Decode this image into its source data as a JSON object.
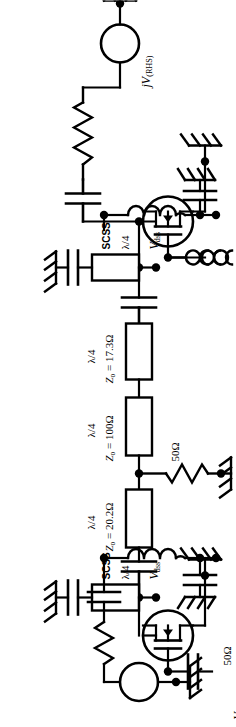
{
  "figure": {
    "type": "circuit-schematic",
    "orientation": "rotated-90-ccw",
    "width": 236,
    "height": 727,
    "line_color": "#000000",
    "background_color": "#ffffff"
  },
  "sources": {
    "right": {
      "label_prefix": "j",
      "label_main": "V",
      "label_sub": "(RHS)",
      "full": "jV(RHS)"
    },
    "left": {
      "label_prefix": "",
      "label_main": "V",
      "label_sub": "(LHS)",
      "full": "V(LHS)"
    }
  },
  "resistors": [
    {
      "name": "source-resistor-rhs",
      "value": ""
    },
    {
      "name": "shunt-resistor-center",
      "value": "50Ω"
    },
    {
      "name": "source-resistor-lhs",
      "value": "50Ω"
    }
  ],
  "transmission_lines": [
    {
      "name": "tline-drain-rhs",
      "length": "λ/4",
      "impedance": "",
      "stub_label": "SCSS"
    },
    {
      "name": "tline-17-3",
      "length": "λ/4",
      "impedance_symbol": "Z",
      "impedance_sub": "o",
      "impedance_value": "17.3Ω",
      "impedance": "Z₀ = 17.3Ω"
    },
    {
      "name": "tline-100",
      "length": "λ/4",
      "impedance_symbol": "Z",
      "impedance_sub": "o",
      "impedance_value": "100Ω",
      "impedance": "Z₀ = 100Ω"
    },
    {
      "name": "tline-20-2",
      "length": "λ/4",
      "impedance_symbol": "Z",
      "impedance_sub": "o",
      "impedance_value": "20.2Ω",
      "impedance": "Z₀ = 20.2Ω"
    },
    {
      "name": "tline-drain-lhs",
      "length": "λ/4",
      "impedance": "",
      "stub_label": "SCSS"
    }
  ],
  "bias": {
    "stub_label": "SCSS",
    "quarter_wave": "λ/4",
    "drain_supply_symbol": "V",
    "drain_supply_sub": "dss",
    "drain_supply": "Vdss",
    "gate_supply_symbol": "V",
    "gate_supply_sub": "gs",
    "gate_supply": "Vgs"
  },
  "nodes": {
    "drain_supply_rhs": "Vdss",
    "drain_supply_lhs": "Vdss",
    "gate_bias_rhs": "Vgs",
    "gate_bias_lhs": "Vgs"
  },
  "components": {
    "transistor_rhs": "mosfet-rhs",
    "transistor_lhs": "mosfet-lhs",
    "inductor_rhs": "gate-choke-rhs",
    "inductor_lhs": "gate-choke-lhs",
    "capacitors": [
      "dc-block-drain-rhs",
      "bypass-cap-rhs",
      "gate-bypass-rhs",
      "dc-block-center-upper",
      "dc-block-center-lower",
      "dc-block-drain-lhs",
      "bypass-cap-lhs",
      "gate-bypass-lhs",
      "source-cap-lhs"
    ],
    "grounds": 9
  }
}
